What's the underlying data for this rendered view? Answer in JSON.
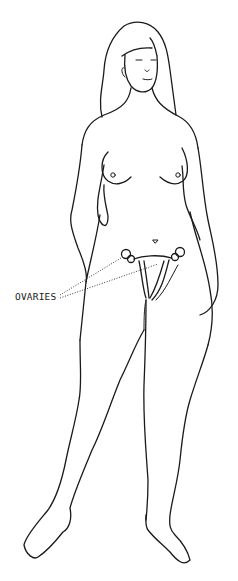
{
  "figure": {
    "labels": [
      {
        "text": "OVARIES",
        "target": "ovaries"
      }
    ]
  },
  "colors": {
    "line": "#1a1a1a",
    "background": "#ffffff"
  }
}
